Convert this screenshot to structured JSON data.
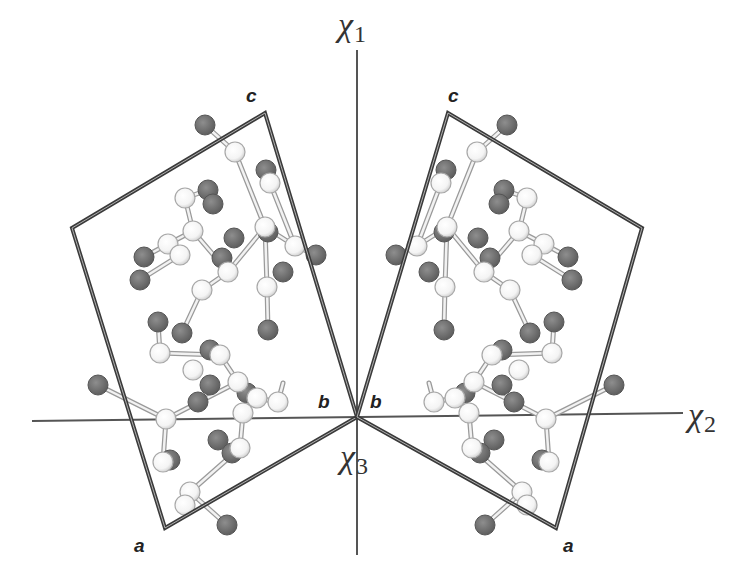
{
  "figure": {
    "axes": {
      "chi1": {
        "symbol": "χ",
        "subscript": "1",
        "label_pos": [
          338,
          8
        ]
      },
      "chi2": {
        "symbol": "χ",
        "subscript": "2",
        "label_pos": [
          688,
          398
        ]
      },
      "chi3": {
        "symbol": "χ",
        "subscript": "3",
        "label_pos": [
          340,
          440
        ]
      },
      "origin": [
        357,
        417
      ],
      "line_color": "#555555"
    },
    "left_cell": {
      "corners": [
        [
          357,
          417
        ],
        [
          265,
          113
        ],
        [
          72,
          228
        ],
        [
          165,
          528
        ]
      ],
      "labels": {
        "c": {
          "text": "c",
          "pos": [
            246,
            86
          ]
        },
        "b": {
          "text": "b",
          "pos": [
            318,
            392
          ]
        },
        "a": {
          "text": "a",
          "pos": [
            134,
            536
          ]
        }
      }
    },
    "right_cell": {
      "corners": [
        [
          357,
          417
        ],
        [
          448,
          113
        ],
        [
          642,
          228
        ],
        [
          556,
          528
        ]
      ],
      "labels": {
        "c": {
          "text": "c",
          "pos": [
            448,
            86
          ]
        },
        "b": {
          "text": "b",
          "pos": [
            370,
            392
          ]
        },
        "a": {
          "text": "a",
          "pos": [
            563,
            536
          ]
        }
      }
    },
    "colors": {
      "cell_edge": "#3a3a3a",
      "atom_light_fill": "#f4f4f4",
      "atom_light_stroke": "#a8a8a8",
      "atom_dark_fill": "#6e6e6e",
      "atom_dark_stroke": "#555555",
      "bond": "#c8c8c8"
    },
    "left_atoms": {
      "light": [
        [
          235,
          152
        ],
        [
          270,
          183
        ],
        [
          185,
          198
        ],
        [
          193,
          231
        ],
        [
          168,
          244
        ],
        [
          265,
          227
        ],
        [
          295,
          246
        ],
        [
          180,
          255
        ],
        [
          228,
          272
        ],
        [
          267,
          287
        ],
        [
          202,
          290
        ],
        [
          160,
          353
        ],
        [
          220,
          355
        ],
        [
          193,
          370
        ],
        [
          238,
          382
        ],
        [
          257,
          398
        ],
        [
          278,
          402
        ],
        [
          243,
          413
        ],
        [
          166,
          419
        ],
        [
          163,
          462
        ],
        [
          240,
          448
        ],
        [
          190,
          492
        ],
        [
          185,
          505
        ]
      ],
      "dark": [
        [
          205,
          125
        ],
        [
          266,
          170
        ],
        [
          208,
          190
        ],
        [
          213,
          204
        ],
        [
          234,
          238
        ],
        [
          222,
          258
        ],
        [
          268,
          232
        ],
        [
          144,
          257
        ],
        [
          140,
          280
        ],
        [
          268,
          330
        ],
        [
          158,
          322
        ],
        [
          182,
          333
        ],
        [
          210,
          350
        ],
        [
          210,
          385
        ],
        [
          247,
          393
        ],
        [
          98,
          385
        ],
        [
          198,
          402
        ],
        [
          218,
          440
        ],
        [
          232,
          453
        ],
        [
          227,
          525
        ],
        [
          170,
          460
        ],
        [
          283,
          272
        ],
        [
          316,
          255
        ]
      ]
    },
    "right_atoms": {
      "light": [
        [
          477,
          152
        ],
        [
          441,
          183
        ],
        [
          527,
          198
        ],
        [
          519,
          231
        ],
        [
          544,
          244
        ],
        [
          447,
          227
        ],
        [
          417,
          246
        ],
        [
          532,
          255
        ],
        [
          484,
          272
        ],
        [
          445,
          287
        ],
        [
          510,
          290
        ],
        [
          552,
          353
        ],
        [
          492,
          355
        ],
        [
          519,
          370
        ],
        [
          474,
          382
        ],
        [
          455,
          398
        ],
        [
          434,
          402
        ],
        [
          469,
          413
        ],
        [
          546,
          419
        ],
        [
          549,
          462
        ],
        [
          472,
          448
        ],
        [
          522,
          492
        ],
        [
          527,
          505
        ]
      ],
      "dark": [
        [
          507,
          125
        ],
        [
          446,
          170
        ],
        [
          504,
          190
        ],
        [
          499,
          204
        ],
        [
          478,
          238
        ],
        [
          490,
          258
        ],
        [
          444,
          232
        ],
        [
          568,
          257
        ],
        [
          572,
          280
        ],
        [
          444,
          330
        ],
        [
          554,
          322
        ],
        [
          530,
          333
        ],
        [
          502,
          350
        ],
        [
          502,
          385
        ],
        [
          465,
          393
        ],
        [
          614,
          385
        ],
        [
          514,
          402
        ],
        [
          494,
          440
        ],
        [
          480,
          453
        ],
        [
          485,
          525
        ],
        [
          542,
          460
        ],
        [
          429,
          272
        ],
        [
          396,
          255
        ]
      ]
    },
    "left_bonds": [
      [
        [
          205,
          125
        ],
        [
          235,
          152
        ]
      ],
      [
        [
          235,
          152
        ],
        [
          265,
          227
        ]
      ],
      [
        [
          265,
          227
        ],
        [
          228,
          272
        ]
      ],
      [
        [
          228,
          272
        ],
        [
          193,
          231
        ]
      ],
      [
        [
          193,
          231
        ],
        [
          185,
          198
        ]
      ],
      [
        [
          185,
          198
        ],
        [
          208,
          190
        ]
      ],
      [
        [
          265,
          227
        ],
        [
          295,
          246
        ]
      ],
      [
        [
          295,
          246
        ],
        [
          316,
          255
        ]
      ],
      [
        [
          265,
          227
        ],
        [
          267,
          287
        ]
      ],
      [
        [
          267,
          287
        ],
        [
          268,
          330
        ]
      ],
      [
        [
          228,
          272
        ],
        [
          202,
          290
        ]
      ],
      [
        [
          202,
          290
        ],
        [
          182,
          333
        ]
      ],
      [
        [
          168,
          244
        ],
        [
          144,
          257
        ]
      ],
      [
        [
          168,
          244
        ],
        [
          193,
          231
        ]
      ],
      [
        [
          180,
          255
        ],
        [
          140,
          280
        ]
      ],
      [
        [
          160,
          353
        ],
        [
          220,
          355
        ]
      ],
      [
        [
          220,
          355
        ],
        [
          238,
          382
        ]
      ],
      [
        [
          238,
          382
        ],
        [
          166,
          419
        ]
      ],
      [
        [
          166,
          419
        ],
        [
          98,
          385
        ]
      ],
      [
        [
          166,
          419
        ],
        [
          163,
          462
        ]
      ],
      [
        [
          238,
          382
        ],
        [
          257,
          398
        ]
      ],
      [
        [
          257,
          398
        ],
        [
          243,
          413
        ]
      ],
      [
        [
          243,
          413
        ],
        [
          240,
          448
        ]
      ],
      [
        [
          240,
          448
        ],
        [
          190,
          492
        ]
      ],
      [
        [
          190,
          492
        ],
        [
          227,
          525
        ]
      ],
      [
        [
          220,
          355
        ],
        [
          210,
          350
        ]
      ],
      [
        [
          257,
          398
        ],
        [
          278,
          402
        ]
      ],
      [
        [
          278,
          402
        ],
        [
          283,
          383
        ]
      ],
      [
        [
          160,
          353
        ],
        [
          158,
          322
        ]
      ],
      [
        [
          270,
          183
        ],
        [
          266,
          170
        ]
      ],
      [
        [
          270,
          183
        ],
        [
          295,
          246
        ]
      ]
    ],
    "right_bonds": [
      [
        [
          507,
          125
        ],
        [
          477,
          152
        ]
      ],
      [
        [
          477,
          152
        ],
        [
          447,
          227
        ]
      ],
      [
        [
          447,
          227
        ],
        [
          484,
          272
        ]
      ],
      [
        [
          484,
          272
        ],
        [
          519,
          231
        ]
      ],
      [
        [
          519,
          231
        ],
        [
          527,
          198
        ]
      ],
      [
        [
          527,
          198
        ],
        [
          504,
          190
        ]
      ],
      [
        [
          447,
          227
        ],
        [
          417,
          246
        ]
      ],
      [
        [
          417,
          246
        ],
        [
          396,
          255
        ]
      ],
      [
        [
          447,
          227
        ],
        [
          445,
          287
        ]
      ],
      [
        [
          445,
          287
        ],
        [
          444,
          330
        ]
      ],
      [
        [
          484,
          272
        ],
        [
          510,
          290
        ]
      ],
      [
        [
          510,
          290
        ],
        [
          530,
          333
        ]
      ],
      [
        [
          544,
          244
        ],
        [
          568,
          257
        ]
      ],
      [
        [
          544,
          244
        ],
        [
          519,
          231
        ]
      ],
      [
        [
          532,
          255
        ],
        [
          572,
          280
        ]
      ],
      [
        [
          552,
          353
        ],
        [
          492,
          355
        ]
      ],
      [
        [
          492,
          355
        ],
        [
          474,
          382
        ]
      ],
      [
        [
          474,
          382
        ],
        [
          546,
          419
        ]
      ],
      [
        [
          546,
          419
        ],
        [
          614,
          385
        ]
      ],
      [
        [
          546,
          419
        ],
        [
          549,
          462
        ]
      ],
      [
        [
          474,
          382
        ],
        [
          455,
          398
        ]
      ],
      [
        [
          455,
          398
        ],
        [
          469,
          413
        ]
      ],
      [
        [
          469,
          413
        ],
        [
          472,
          448
        ]
      ],
      [
        [
          472,
          448
        ],
        [
          522,
          492
        ]
      ],
      [
        [
          522,
          492
        ],
        [
          485,
          525
        ]
      ],
      [
        [
          492,
          355
        ],
        [
          502,
          350
        ]
      ],
      [
        [
          455,
          398
        ],
        [
          434,
          402
        ]
      ],
      [
        [
          434,
          402
        ],
        [
          429,
          383
        ]
      ],
      [
        [
          552,
          353
        ],
        [
          554,
          322
        ]
      ],
      [
        [
          441,
          183
        ],
        [
          446,
          170
        ]
      ],
      [
        [
          441,
          183
        ],
        [
          417,
          246
        ]
      ]
    ]
  }
}
